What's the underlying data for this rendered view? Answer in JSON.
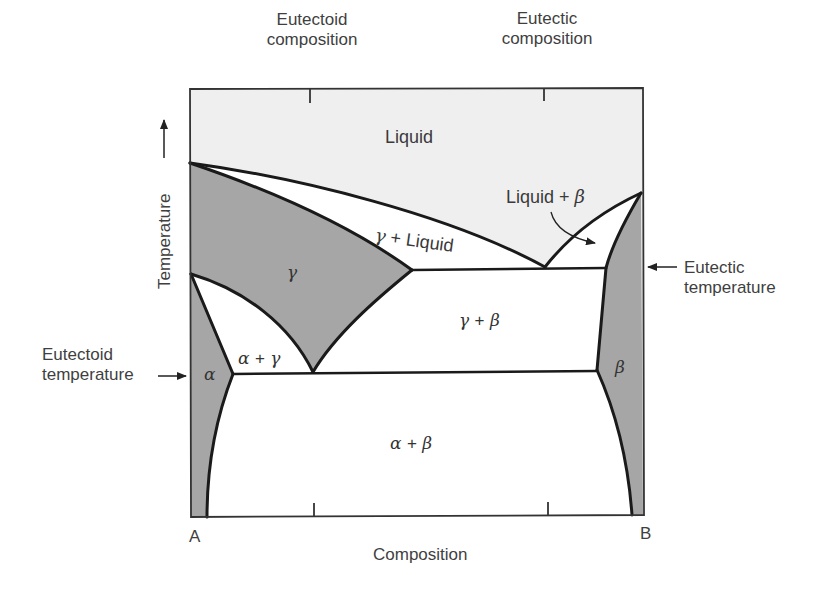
{
  "diagram": {
    "type": "binary-phase-diagram",
    "axes": {
      "x_label": "Composition",
      "y_label": "Temperature",
      "left_end_label": "A",
      "right_end_label": "B"
    },
    "top_labels": {
      "eutectoid_composition_line1": "Eutectoid",
      "eutectoid_composition_line2": "composition",
      "eutectic_composition_line1": "Eutectic",
      "eutectic_composition_line2": "composition"
    },
    "side_labels": {
      "eutectic_temperature_line1": "Eutectic",
      "eutectic_temperature_line2": "temperature",
      "eutectoid_temperature_line1": "Eutectoid",
      "eutectoid_temperature_line2": "temperature"
    },
    "phase_regions": {
      "liquid": "Liquid",
      "liquid_plus_beta": {
        "left": "Liquid",
        "plus": "+",
        "right": "β"
      },
      "gamma_plus_liquid": {
        "left": "γ",
        "plus": "+",
        "right": "Liquid"
      },
      "gamma": "γ",
      "gamma_plus_beta": {
        "left": "γ",
        "plus": "+",
        "right": "β"
      },
      "alpha_plus_gamma": {
        "left": "α",
        "plus": "+",
        "right": "γ"
      },
      "alpha": "α",
      "beta": "β",
      "alpha_plus_beta": {
        "left": "α",
        "plus": "+",
        "right": "β"
      }
    },
    "colors": {
      "single_phase_fill": "#a6a6a6",
      "liquid_fill": "#efefef",
      "two_phase_fill": "#ffffff",
      "line": "#1a1a1a",
      "text": "#3f3f3f"
    }
  }
}
